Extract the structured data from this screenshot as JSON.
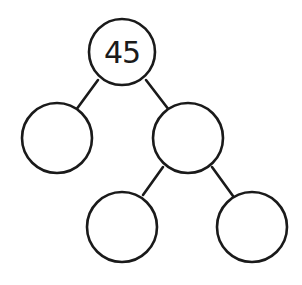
{
  "diagram": {
    "type": "number-bond-tree",
    "nodes": [
      {
        "id": "root",
        "value": "45"
      },
      {
        "id": "left",
        "value": ""
      },
      {
        "id": "right",
        "value": ""
      },
      {
        "id": "right-left",
        "value": ""
      },
      {
        "id": "right-right",
        "value": ""
      }
    ],
    "edges": [
      {
        "from": "root",
        "to": "left"
      },
      {
        "from": "root",
        "to": "right"
      },
      {
        "from": "right",
        "to": "right-left"
      },
      {
        "from": "right",
        "to": "right-right"
      }
    ],
    "colors": {
      "stroke": "#1a1a1a",
      "fill": "#ffffff"
    }
  }
}
